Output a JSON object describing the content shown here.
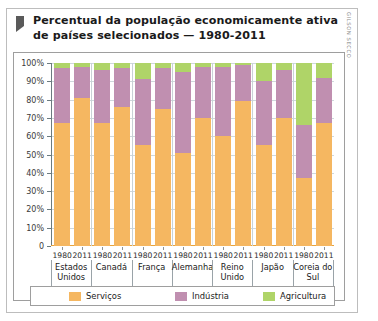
{
  "credit": "GILSON SECCO",
  "title": "Percentual da população economicamente ativa de países selecionados — 1980-2011",
  "legend": [
    {
      "label": "Serviços",
      "color": "#F5B761"
    },
    {
      "label": "Indústria",
      "color": "#C08FB0"
    },
    {
      "label": "Agricultura",
      "color": "#AFD468"
    }
  ],
  "chart_data": {
    "type": "bar",
    "subtype": "stacked-percent",
    "title": "Percentual da população economicamente ativa de países selecionados — 1980-2011",
    "xlabel": "",
    "ylabel": "",
    "ylim": [
      0,
      100
    ],
    "yticks": [
      "0",
      "10%",
      "20%",
      "30%",
      "40%",
      "50%",
      "60%",
      "70%",
      "80%",
      "90%",
      "100%"
    ],
    "grid": true,
    "legend_position": "bottom",
    "categories": [
      "Estados Unidos 1980",
      "Estados Unidos 2011",
      "Canadá 1980",
      "Canadá 2011",
      "França 1980",
      "França 2011",
      "Alemanha 1980",
      "Alemanha 2011",
      "Reino Unido 1980",
      "Reino Unido 2011",
      "Japão 1980",
      "Japão 2011",
      "Coreia do Sul 1980",
      "Coreia do Sul 2011"
    ],
    "groups": [
      {
        "country": "Estados Unidos",
        "years": [
          "1980",
          "2011"
        ]
      },
      {
        "country": "Canadá",
        "years": [
          "1980",
          "2011"
        ]
      },
      {
        "country": "França",
        "years": [
          "1980",
          "2011"
        ]
      },
      {
        "country": "Alemanha",
        "years": [
          "1980",
          "2011"
        ]
      },
      {
        "country": "Reino Unido",
        "years": [
          "1980",
          "2011"
        ]
      },
      {
        "country": "Japão",
        "years": [
          "1980",
          "2011"
        ]
      },
      {
        "country": "Coreia do Sul",
        "years": [
          "1980",
          "2011"
        ]
      }
    ],
    "series": [
      {
        "name": "Serviços",
        "color": "#F5B761",
        "values": [
          67,
          81,
          67,
          76,
          55,
          75,
          51,
          70,
          60,
          79,
          55,
          70,
          37,
          67
        ]
      },
      {
        "name": "Indústria",
        "color": "#C08FB0",
        "values": [
          30,
          17,
          29,
          21,
          36,
          22,
          44,
          28,
          38,
          20,
          35,
          26,
          29,
          25
        ]
      },
      {
        "name": "Agricultura",
        "color": "#AFD468",
        "values": [
          3,
          2,
          4,
          3,
          9,
          3,
          5,
          2,
          2,
          1,
          10,
          4,
          34,
          8
        ]
      }
    ],
    "bars": [
      {
        "country": "Estados Unidos",
        "year": "1980",
        "servicos": 67,
        "industria": 30,
        "agricultura": 3
      },
      {
        "country": "Estados Unidos",
        "year": "2011",
        "servicos": 81,
        "industria": 17,
        "agricultura": 2
      },
      {
        "country": "Canadá",
        "year": "1980",
        "servicos": 67,
        "industria": 29,
        "agricultura": 4
      },
      {
        "country": "Canadá",
        "year": "2011",
        "servicos": 76,
        "industria": 21,
        "agricultura": 3
      },
      {
        "country": "França",
        "year": "1980",
        "servicos": 55,
        "industria": 36,
        "agricultura": 9
      },
      {
        "country": "França",
        "year": "2011",
        "servicos": 75,
        "industria": 22,
        "agricultura": 3
      },
      {
        "country": "Alemanha",
        "year": "1980",
        "servicos": 51,
        "industria": 44,
        "agricultura": 5
      },
      {
        "country": "Alemanha",
        "year": "2011",
        "servicos": 70,
        "industria": 28,
        "agricultura": 2
      },
      {
        "country": "Reino Unido",
        "year": "1980",
        "servicos": 60,
        "industria": 38,
        "agricultura": 2
      },
      {
        "country": "Reino Unido",
        "year": "2011",
        "servicos": 79,
        "industria": 20,
        "agricultura": 1
      },
      {
        "country": "Japão",
        "year": "1980",
        "servicos": 55,
        "industria": 35,
        "agricultura": 10
      },
      {
        "country": "Japão",
        "year": "2011",
        "servicos": 70,
        "industria": 26,
        "agricultura": 4
      },
      {
        "country": "Coreia do Sul",
        "year": "1980",
        "servicos": 37,
        "industria": 29,
        "agricultura": 34
      },
      {
        "country": "Coreia do Sul",
        "year": "2011",
        "servicos": 67,
        "industria": 25,
        "agricultura": 8
      }
    ]
  }
}
